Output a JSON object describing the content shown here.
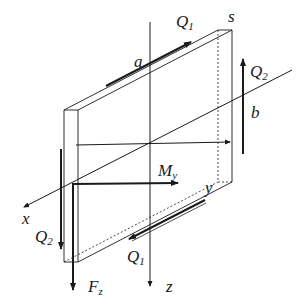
{
  "diagram": {
    "type": "plate-element-forces",
    "colors": {
      "line": "#1a1a1a",
      "background": "#ffffff"
    },
    "labels": {
      "a": "a",
      "s": "s",
      "b": "b",
      "y": "y",
      "x": "x",
      "z": "z",
      "q1_top": "Q",
      "q1_top_sub": "1",
      "q2_right": "Q",
      "q2_right_sub": "2",
      "q2_left": "Q",
      "q2_left_sub": "2",
      "q1_bottom": "Q",
      "q1_bottom_sub": "1",
      "my": "M",
      "my_sub": "y",
      "fz": "F",
      "fz_sub": "z"
    }
  }
}
